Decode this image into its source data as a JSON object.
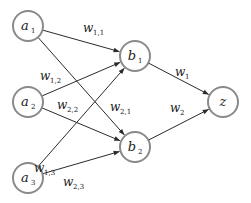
{
  "diagram": {
    "type": "neural-network",
    "colors": {
      "node_stroke": "#8a8a8a",
      "edge": "#2b2b2b",
      "text": "#222222",
      "background": "#ffffff"
    },
    "nodes": [
      {
        "id": "a1",
        "base": "a",
        "sub": "1",
        "x": 28,
        "y": 26
      },
      {
        "id": "a2",
        "base": "a",
        "sub": "2",
        "x": 28,
        "y": 102
      },
      {
        "id": "a3",
        "base": "a",
        "sub": "3",
        "x": 28,
        "y": 178
      },
      {
        "id": "b1",
        "base": "b",
        "sub": "1",
        "x": 135,
        "y": 56
      },
      {
        "id": "b2",
        "base": "b",
        "sub": "2",
        "x": 135,
        "y": 147
      },
      {
        "id": "z",
        "base": "z",
        "sub": "",
        "x": 223,
        "y": 102
      }
    ],
    "edges": [
      {
        "from": "a1",
        "to": "b1"
      },
      {
        "from": "a1",
        "to": "b2"
      },
      {
        "from": "a2",
        "to": "b1"
      },
      {
        "from": "a2",
        "to": "b2"
      },
      {
        "from": "a3",
        "to": "b1"
      },
      {
        "from": "a3",
        "to": "b2"
      },
      {
        "from": "b1",
        "to": "z"
      },
      {
        "from": "b2",
        "to": "z"
      }
    ],
    "weights": [
      {
        "base": "w",
        "sub": "1,1",
        "x": 83,
        "y": 32
      },
      {
        "base": "w",
        "sub": "1,2",
        "x": 40,
        "y": 80
      },
      {
        "base": "w",
        "sub": "2,2",
        "x": 57,
        "y": 109
      },
      {
        "base": "w",
        "sub": "2,1",
        "x": 110,
        "y": 111
      },
      {
        "base": "w",
        "sub": "1,3",
        "x": 34,
        "y": 172
      },
      {
        "base": "w",
        "sub": "2,3",
        "x": 63,
        "y": 186
      },
      {
        "base": "w",
        "sub": "1",
        "x": 175,
        "y": 76
      },
      {
        "base": "w",
        "sub": "2",
        "x": 170,
        "y": 112
      }
    ]
  }
}
